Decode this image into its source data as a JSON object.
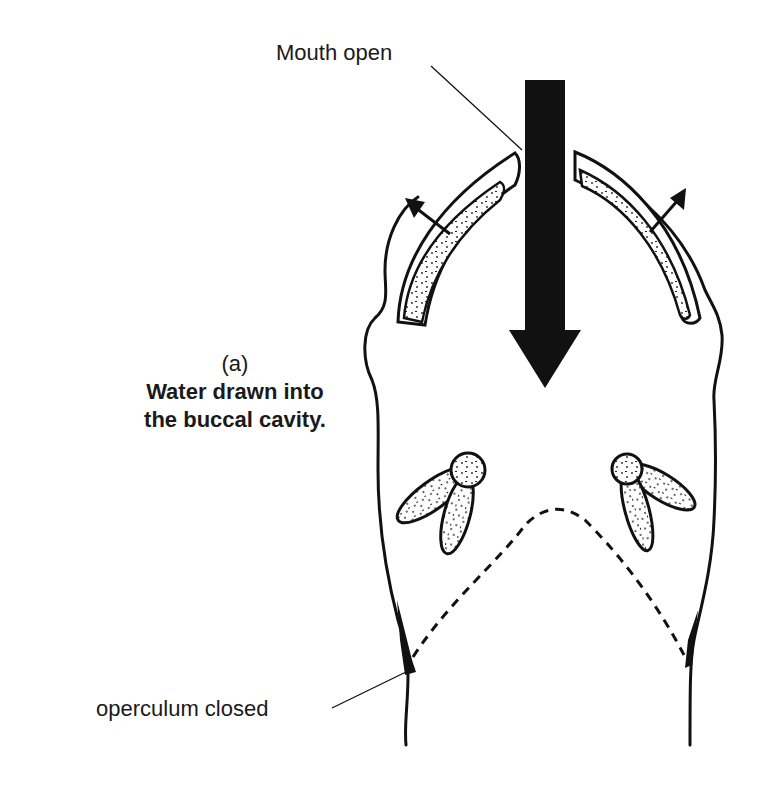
{
  "figure": {
    "panel_label": "(a)",
    "caption_lines": [
      "Water drawn into",
      "the buccal cavity."
    ]
  },
  "labels": {
    "mouth": "Mouth open",
    "operculum": "operculum closed"
  },
  "colors": {
    "ink": "#111111",
    "background": "#ffffff",
    "stipple_fill": "#ffffff"
  },
  "arrows": {
    "main_flow": "water-inflow-arrow (downward, into mouth)",
    "left_expansion": "buccal-expansion-arrow (outward, up-left)",
    "right_expansion": "buccal-expansion-arrow (outward, up-right)"
  }
}
